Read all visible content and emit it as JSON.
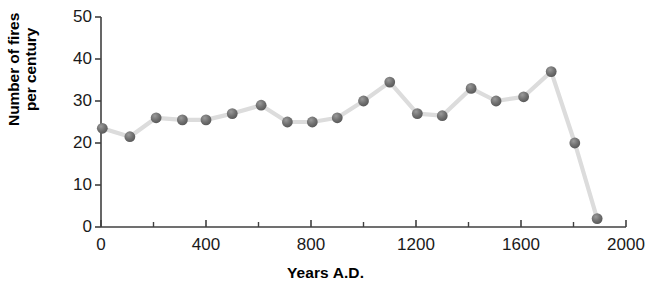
{
  "chart_data": {
    "type": "line",
    "title": "",
    "xlabel": "Years A.D.",
    "ylabel": "Number of fires\nper century",
    "xlim": [
      0,
      2000
    ],
    "ylim": [
      0,
      50
    ],
    "grid": false,
    "legend": "none",
    "marker": "filled-circle",
    "marker_color": "#6e6e6e",
    "line_color": "#dcdcdc",
    "axis_color": "#404040",
    "xticks": [
      0,
      400,
      800,
      1200,
      1600,
      2000
    ],
    "xtick_labels": [
      "0",
      "400",
      "800",
      "1200",
      "1600",
      "2000"
    ],
    "xminor_ticks": [
      200,
      600,
      1000,
      1400,
      1800
    ],
    "yticks": [
      0,
      10,
      20,
      30,
      40,
      50
    ],
    "ytick_labels": [
      "0",
      "10",
      "20",
      "30",
      "40",
      "50"
    ],
    "series": [
      {
        "name": "fires per century",
        "x": [
          5,
          110,
          210,
          310,
          400,
          500,
          610,
          710,
          805,
          900,
          1000,
          1100,
          1205,
          1300,
          1410,
          1505,
          1610,
          1715,
          1805,
          1890
        ],
        "values": [
          23.5,
          21.5,
          26,
          25.5,
          25.5,
          27,
          29,
          25,
          25,
          26,
          30,
          34.5,
          27,
          26.5,
          33,
          30,
          31,
          37,
          20,
          2
        ]
      }
    ]
  },
  "axes": {
    "ylabel_line1": "Number of fires",
    "ylabel_line2": "per century",
    "xlabel": "Years A.D."
  }
}
